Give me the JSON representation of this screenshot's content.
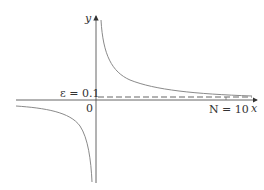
{
  "diagram": {
    "axes": {
      "x_label": "x",
      "y_label": "y",
      "origin_label": "0"
    },
    "annotations": {
      "epsilon_label": "ε = 0.1",
      "n_label": "N = 10"
    },
    "colors": {
      "axis": "#444444",
      "curve": "#888888",
      "dashed": "#555555",
      "text": "#333333"
    }
  }
}
